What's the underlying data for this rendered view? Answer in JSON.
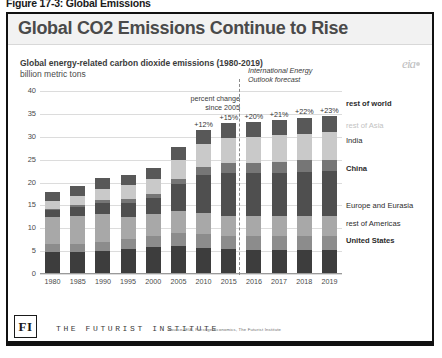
{
  "figure_caption": "Figure 17-3: Global Emissions",
  "slide": {
    "title": "Global CO2 Emissions Continue to Rise",
    "eia_logo": "eia",
    "footer": {
      "logo_text": "FI",
      "org_name": "THE FUTURIST INSTITUTE",
      "source": "Source: EIA, Prestige Economics, The Futurist Institute"
    }
  },
  "chart_data": {
    "type": "bar",
    "stacked": true,
    "title": "Global energy-related carbon dioxide emissions (1980-2019)",
    "subtitle": "billion metric tons",
    "xlabel": "",
    "ylabel": "billion metric tons",
    "ylim": [
      0,
      40
    ],
    "yticks": [
      0,
      5,
      10,
      15,
      20,
      25,
      30,
      35,
      40
    ],
    "grid": true,
    "legend_position": "right",
    "forecast_note": "International Energy\nOutlook forecast",
    "forecast_note_line1": "International Energy",
    "forecast_note_line2": "Outlook forecast",
    "percent_note_line1": "percent change",
    "percent_note_line2": "since 2005",
    "forecast_start_year": "2016",
    "categories": [
      "1980",
      "1985",
      "1990",
      "1995",
      "2000",
      "2005",
      "2010",
      "2015",
      "2016",
      "2017",
      "2018",
      "2019"
    ],
    "annotations": [
      {
        "category": "2010",
        "label": "+12%"
      },
      {
        "category": "2015",
        "label": "+15%"
      },
      {
        "category": "2016",
        "label": "+20%"
      },
      {
        "category": "2017",
        "label": "+21%"
      },
      {
        "category": "2018",
        "label": "+22%"
      },
      {
        "category": "2019",
        "label": "+23%"
      }
    ],
    "series": [
      {
        "name": "United States",
        "color": "#3d3d3d",
        "values": [
          4.7,
          4.6,
          4.9,
          5.2,
          5.7,
          5.9,
          5.5,
          5.2,
          5.1,
          5.1,
          5.1,
          5.1
        ]
      },
      {
        "name": "rest of Americas",
        "color": "#8c8c8c",
        "values": [
          1.6,
          1.7,
          1.9,
          2.2,
          2.5,
          2.8,
          3.0,
          3.0,
          3.0,
          3.0,
          3.1,
          3.1
        ]
      },
      {
        "name": "Europe and Eurasia",
        "color": "#a8a8a8",
        "values": [
          6.0,
          6.2,
          6.2,
          4.9,
          4.7,
          4.8,
          4.7,
          4.3,
          4.3,
          4.3,
          4.3,
          4.3
        ]
      },
      {
        "name": "China",
        "color": "#4f4f4f",
        "values": [
          1.5,
          1.9,
          2.3,
          3.1,
          3.4,
          5.9,
          8.2,
          9.4,
          9.4,
          9.5,
          9.6,
          9.7
        ]
      },
      {
        "name": "India",
        "color": "#767676",
        "values": [
          0.3,
          0.4,
          0.6,
          0.8,
          1.0,
          1.2,
          1.7,
          2.2,
          2.3,
          2.4,
          2.5,
          2.6
        ]
      },
      {
        "name": "rest of Asia",
        "color": "#c9c9c9",
        "values": [
          1.7,
          2.0,
          2.4,
          3.1,
          3.3,
          4.2,
          5.0,
          5.5,
          5.7,
          5.8,
          5.9,
          6.0
        ]
      },
      {
        "name": "rest of world",
        "color": "#585858",
        "values": [
          2.0,
          2.2,
          2.4,
          2.2,
          2.3,
          2.7,
          3.1,
          3.2,
          3.3,
          3.4,
          3.5,
          3.5
        ]
      }
    ],
    "legend_entries": [
      {
        "label": "rest of world",
        "style": "bold"
      },
      {
        "label": "rest of Asia",
        "style": "faint"
      },
      {
        "label": "India",
        "style": "normal"
      },
      {
        "label": "China",
        "style": "bold"
      },
      {
        "label": "Europe and Eurasia",
        "style": "normal"
      },
      {
        "label": "rest of Americas",
        "style": "normal"
      },
      {
        "label": "United States",
        "style": "bold"
      }
    ]
  }
}
